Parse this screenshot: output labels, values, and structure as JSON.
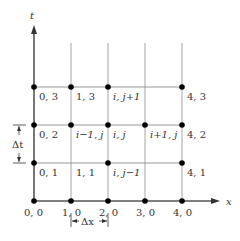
{
  "diagram": {
    "axes": {
      "x_label": "x",
      "t_label": "t"
    },
    "grid": {
      "columns": 5,
      "rows": 4
    },
    "node_labels": {
      "n00": "0, 0",
      "n10": "1, 0",
      "n20": "2, 0",
      "n30": "3, 0",
      "n40": "4, 0",
      "n01": "0, 1",
      "n11": "1, 1",
      "n21": "i, j−1",
      "n41": "4, 1",
      "n02": "0, 2",
      "n12": "i−1, j",
      "n22": "i, j",
      "n32": "i+1, j",
      "n42": "4, 2",
      "n03": "0, 3",
      "n13": "1, 3",
      "n23": "i, j+1",
      "n43": "4, 3"
    },
    "dimensions": {
      "dx_label": "Δx",
      "dt_label": "Δt"
    },
    "colors": {
      "axis": "#555555",
      "grid": "#999999",
      "node": "#000000",
      "text": "#333333"
    }
  }
}
